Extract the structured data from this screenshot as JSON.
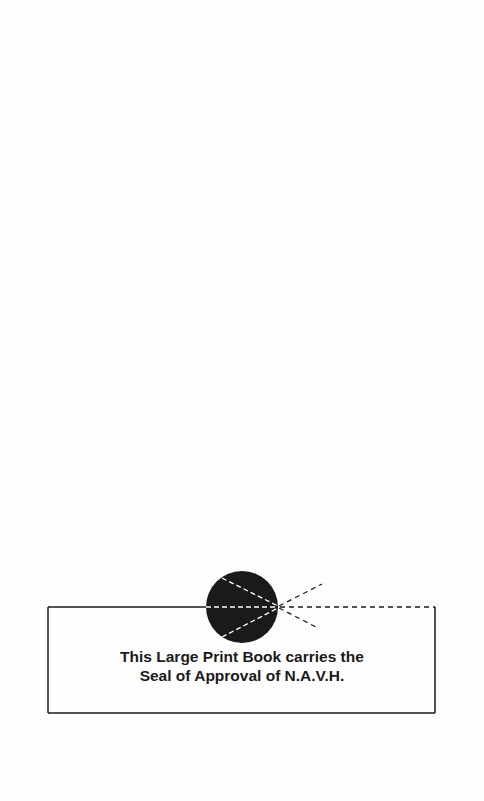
{
  "page": {
    "background": "#fefefe",
    "seal_box": {
      "line1": "This Large Print Book carries the",
      "line2": "Seal of Approval of N.A.V.H.",
      "ink_color": "#1a1a1a"
    },
    "seal_icon": "navh-seal-eye-icon"
  }
}
